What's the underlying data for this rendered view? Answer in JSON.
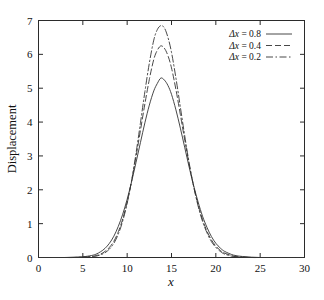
{
  "chart_data": {
    "type": "line",
    "title": "",
    "xlabel": "x",
    "ylabel": "Displacement",
    "xlim": [
      0,
      30
    ],
    "ylim": [
      0,
      7
    ],
    "xticks": [
      0,
      5,
      10,
      15,
      20,
      25,
      30
    ],
    "yticks": [
      0,
      1,
      2,
      3,
      4,
      5,
      6,
      7
    ],
    "grid": false,
    "legend_position": "top-right",
    "peak_center": 13.8,
    "series": [
      {
        "name": "Δx = 0.8",
        "label_symbol": "Δx",
        "label_value": "0.8",
        "linestyle": "solid",
        "peak_value": 5.3,
        "width_sigma": 2.35,
        "x": [
          0,
          1,
          2,
          3,
          4,
          5,
          6,
          6.5,
          7,
          7.5,
          8,
          8.5,
          9,
          9.5,
          10,
          10.5,
          11,
          11.5,
          12,
          12.5,
          13,
          13.4,
          13.8,
          14.2,
          14.6,
          15,
          15.5,
          16,
          16.5,
          17,
          17.5,
          18,
          18.5,
          19,
          19.5,
          20,
          20.5,
          21,
          22,
          23,
          24,
          25,
          26,
          27,
          28,
          29,
          30
        ],
        "y": [
          0,
          0,
          0,
          0,
          0.01,
          0.02,
          0.06,
          0.1,
          0.17,
          0.27,
          0.42,
          0.63,
          0.92,
          1.28,
          1.72,
          2.24,
          2.81,
          3.4,
          3.98,
          4.5,
          4.92,
          5.14,
          5.3,
          5.24,
          5.08,
          4.82,
          4.36,
          3.82,
          3.24,
          2.66,
          2.12,
          1.64,
          1.22,
          0.89,
          0.62,
          0.42,
          0.28,
          0.18,
          0.07,
          0.03,
          0.01,
          0,
          0,
          0,
          0,
          0,
          0
        ]
      },
      {
        "name": "Δx = 0.4",
        "label_symbol": "Δx",
        "label_value": "0.4",
        "linestyle": "dashed",
        "peak_value": 6.25,
        "width_sigma": 2.05,
        "x": [
          0,
          1,
          2,
          3,
          4,
          5,
          6,
          6.5,
          7,
          7.5,
          8,
          8.5,
          9,
          9.5,
          10,
          10.5,
          11,
          11.5,
          12,
          12.5,
          13,
          13.4,
          13.8,
          14.2,
          14.6,
          15,
          15.5,
          16,
          16.5,
          17,
          17.5,
          18,
          18.5,
          19,
          19.5,
          20,
          20.5,
          21,
          22,
          23,
          24,
          25,
          26,
          27,
          28,
          29,
          30
        ],
        "y": [
          0,
          0,
          0,
          0,
          0,
          0.01,
          0.03,
          0.06,
          0.1,
          0.18,
          0.3,
          0.48,
          0.76,
          1.14,
          1.64,
          2.26,
          2.98,
          3.76,
          4.54,
          5.26,
          5.85,
          6.12,
          6.25,
          6.18,
          5.96,
          5.6,
          4.96,
          4.22,
          3.46,
          2.74,
          2.1,
          1.56,
          1.12,
          0.78,
          0.52,
          0.34,
          0.21,
          0.13,
          0.04,
          0.01,
          0,
          0,
          0,
          0,
          0,
          0,
          0
        ]
      },
      {
        "name": "Δx = 0.2",
        "label_symbol": "Δx",
        "label_value": "0.2",
        "linestyle": "dashdot",
        "peak_value": 6.85,
        "width_sigma": 1.95,
        "x": [
          0,
          1,
          2,
          3,
          4,
          5,
          6,
          6.5,
          7,
          7.5,
          8,
          8.5,
          9,
          9.5,
          10,
          10.5,
          11,
          11.5,
          12,
          12.5,
          13,
          13.4,
          13.8,
          14.2,
          14.6,
          15,
          15.5,
          16,
          16.5,
          17,
          17.5,
          18,
          18.5,
          19,
          19.5,
          20,
          20.5,
          21,
          22,
          23,
          24,
          25,
          26,
          27,
          28,
          29,
          30
        ],
        "y": [
          0,
          0,
          0,
          0,
          0,
          0.01,
          0.02,
          0.04,
          0.08,
          0.14,
          0.25,
          0.42,
          0.69,
          1.08,
          1.6,
          2.27,
          3.08,
          3.98,
          4.9,
          5.74,
          6.42,
          6.73,
          6.85,
          6.78,
          6.5,
          6.06,
          5.3,
          4.44,
          3.58,
          2.78,
          2.1,
          1.52,
          1.07,
          0.73,
          0.47,
          0.3,
          0.18,
          0.1,
          0.03,
          0.01,
          0,
          0,
          0,
          0,
          0,
          0,
          0
        ]
      }
    ]
  },
  "axes": {
    "ylabel": "Displacement",
    "xlabel": "x",
    "xtick_labels": [
      "0",
      "5",
      "10",
      "15",
      "20",
      "25",
      "30"
    ],
    "ytick_labels": [
      "0",
      "1",
      "2",
      "3",
      "4",
      "5",
      "6",
      "7"
    ]
  },
  "legend": {
    "entries": [
      {
        "label": "Δx = 0.8",
        "style": "solid"
      },
      {
        "label": "Δx = 0.4",
        "style": "dashed"
      },
      {
        "label": "Δx = 0.2",
        "style": "dashdot"
      }
    ]
  },
  "style": {
    "background": "#ffffff",
    "axis_color": "#2b2b2b",
    "curve_color": "#333333"
  }
}
